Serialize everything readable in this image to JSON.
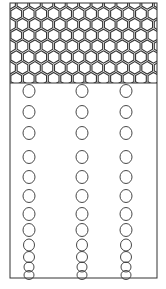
{
  "diagram": {
    "width": 166,
    "height": 289,
    "stroke_color": "#333333",
    "background": "#ffffff",
    "container": {
      "x": 10,
      "y": 3,
      "width": 147,
      "height": 275
    },
    "honeycomb_region": {
      "x": 10,
      "y": 3,
      "width": 147,
      "height": 80,
      "hex_radius": 7.2
    },
    "columns_x": [
      29,
      82,
      126
    ],
    "circle_rows": [
      {
        "cy": 91,
        "rx": 6,
        "ry": 6.5
      },
      {
        "cy": 112,
        "rx": 6,
        "ry": 6.5
      },
      {
        "cy": 133,
        "rx": 6,
        "ry": 6.5
      },
      {
        "cy": 157,
        "rx": 6,
        "ry": 6.5
      },
      {
        "cy": 177,
        "rx": 6,
        "ry": 6.5
      },
      {
        "cy": 196,
        "rx": 6,
        "ry": 6.5
      },
      {
        "cy": 214,
        "rx": 6,
        "ry": 6.5
      },
      {
        "cy": 230,
        "rx": 6,
        "ry": 6.5
      },
      {
        "cy": 245,
        "rx": 5.5,
        "ry": 6
      },
      {
        "cy": 257,
        "rx": 5.5,
        "ry": 5.5
      },
      {
        "cy": 267,
        "rx": 5,
        "ry": 5
      },
      {
        "cy": 275,
        "rx": 5,
        "ry": 4.5
      }
    ]
  }
}
